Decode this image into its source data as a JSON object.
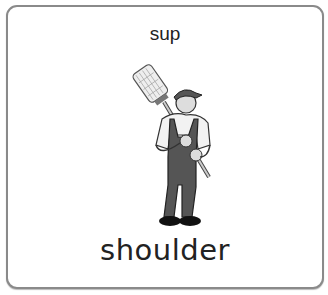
{
  "card": {
    "top_label": "sup",
    "word": "shoulder",
    "image": "man-carrying-broom-on-shoulder"
  }
}
